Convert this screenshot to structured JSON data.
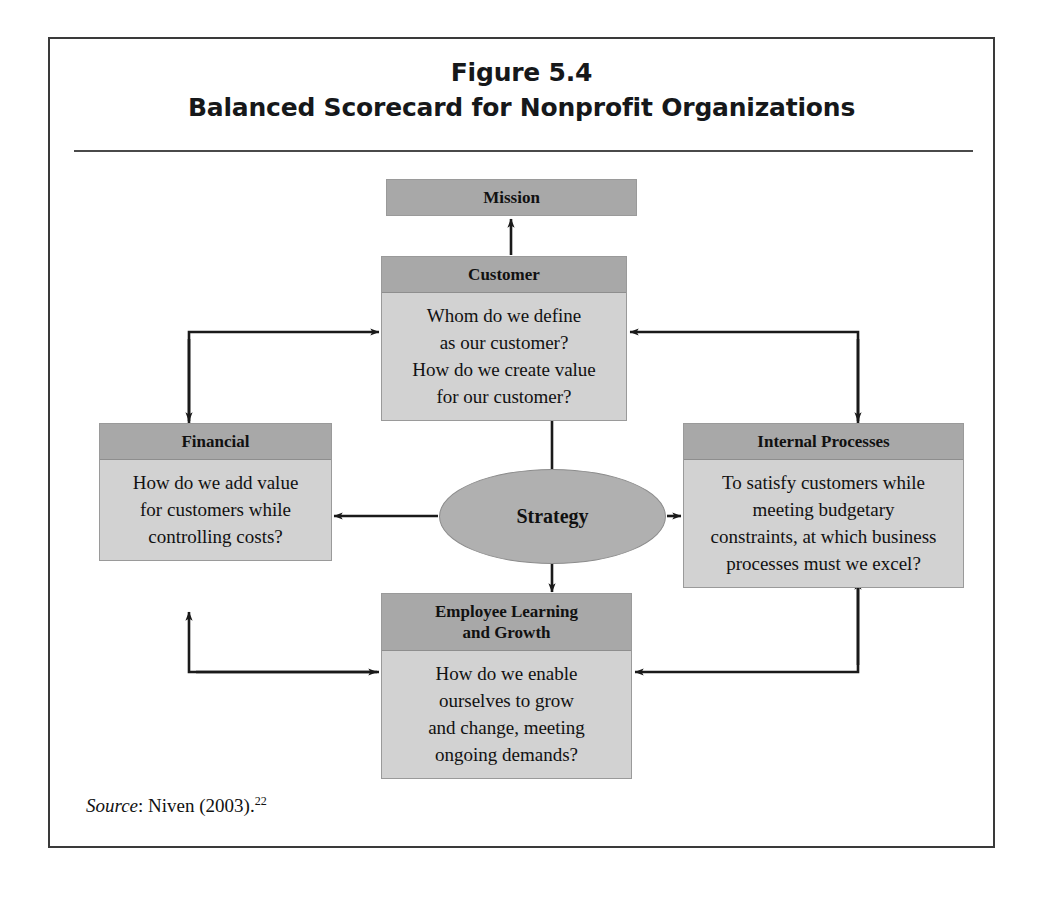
{
  "figure": {
    "number": "Figure 5.4",
    "subtitle": "Balanced Scorecard for Nonprofit Organizations"
  },
  "colors": {
    "header_fill": "#a8a8a8",
    "body_fill": "#d2d2d2",
    "ellipse_fill": "#b0b0b0",
    "border": "#9a9a9a",
    "frame_border": "#3a3a3a",
    "arrow": "#1a1a1a",
    "text": "#111111"
  },
  "diagram": {
    "type": "balanced-scorecard",
    "center": {
      "label": "Strategy",
      "shape": "ellipse"
    },
    "nodes": [
      {
        "id": "mission",
        "title": "Mission",
        "lines": []
      },
      {
        "id": "customer",
        "title": "Customer",
        "lines": [
          "Whom do we define",
          "as our customer?",
          "How do we create value",
          "for our customer?"
        ]
      },
      {
        "id": "financial",
        "title": "Financial",
        "lines": [
          "How do we add value",
          "for customers while",
          "controlling costs?"
        ]
      },
      {
        "id": "internal",
        "title": "Internal Processes",
        "lines": [
          "To satisfy customers while",
          "meeting budgetary",
          "constraints, at which business",
          "processes must we excel?"
        ]
      },
      {
        "id": "employee",
        "title_lines": [
          "Employee Learning",
          "and Growth"
        ],
        "title": "Employee Learning and Growth",
        "lines": [
          "How do we enable",
          "ourselves to grow",
          "and change, meeting",
          "ongoing demands?"
        ]
      }
    ],
    "connections": [
      {
        "from": "customer",
        "to": "mission",
        "style": "straight-arrow-up"
      },
      {
        "from": "strategy",
        "to": "customer",
        "style": "straight-arrow-up"
      },
      {
        "from": "strategy",
        "to": "financial",
        "style": "straight-arrow-left"
      },
      {
        "from": "strategy",
        "to": "internal",
        "style": "straight-arrow-right"
      },
      {
        "from": "strategy",
        "to": "employee",
        "style": "straight-arrow-down"
      },
      {
        "from": "financial",
        "to": "customer",
        "style": "elbow-up-right"
      },
      {
        "from": "internal",
        "to": "customer",
        "style": "elbow-up-left"
      },
      {
        "from": "employee",
        "to": "financial",
        "style": "elbow-left-up"
      },
      {
        "from": "internal",
        "to": "employee",
        "style": "elbow-down-left"
      }
    ]
  },
  "source": {
    "label": "Source",
    "text": ": Niven (2003).",
    "footnote": "22"
  }
}
